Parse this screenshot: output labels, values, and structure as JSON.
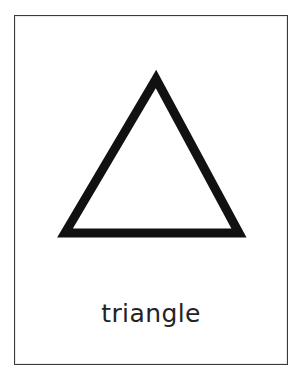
{
  "page": {
    "background_color": "#ffffff",
    "width": 302,
    "height": 387
  },
  "card": {
    "type": "educational-flashcard",
    "border_color": "#3a3a3c",
    "background_color": "#ffffff",
    "caption": "triangle",
    "caption_color": "#232325"
  },
  "shape": {
    "name": "triangle",
    "icon_name": "triangle-outline-icon",
    "stroke_color": "#111112",
    "fill_color": "#ffffff",
    "stroke_width": 8,
    "sides": 3,
    "apex": {
      "x": 155,
      "y": 78
    },
    "bottom_left": {
      "x": 64,
      "y": 232
    },
    "bottom_right": {
      "x": 238,
      "y": 232
    }
  }
}
